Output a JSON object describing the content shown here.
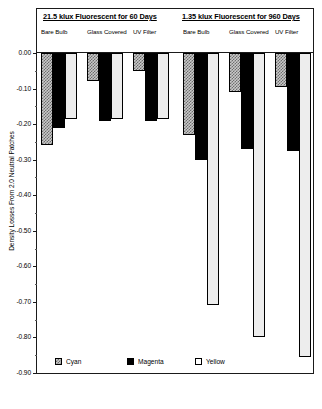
{
  "chart_data": {
    "type": "bar",
    "title": "",
    "xlabel": "",
    "ylabel": "Density Losses From 2.0 Neutral Patches",
    "ylim": [
      -0.9,
      0.0
    ],
    "ytick_step": 0.1,
    "grid": false,
    "legend_position": "bottom-left",
    "ytick_labels": [
      "0.00",
      "-0.10",
      "-0.20",
      "-0.30",
      "-0.40",
      "-0.50",
      "-0.60",
      "-0.70",
      "-0.80",
      "-0.90"
    ],
    "ytick_values": [
      0.0,
      -0.1,
      -0.2,
      -0.3,
      -0.4,
      -0.5,
      -0.6,
      -0.7,
      -0.8,
      -0.9
    ],
    "legend": [
      {
        "name": "Cyan",
        "swatch": "hatched"
      },
      {
        "name": "Magenta",
        "swatch": "solid-black"
      },
      {
        "name": "Yellow",
        "swatch": "white-outline"
      }
    ],
    "groups": [
      {
        "title": "21.5 klux Fluorescent for 60 Days",
        "categories": [
          "Bare Bulb",
          "Glass Covered",
          "UV Filter"
        ],
        "series": [
          {
            "name": "Cyan",
            "values": [
              -0.26,
              -0.08,
              -0.05
            ]
          },
          {
            "name": "Magenta",
            "values": [
              -0.21,
              -0.19,
              -0.19
            ]
          },
          {
            "name": "Yellow",
            "values": [
              -0.185,
              -0.185,
              -0.185
            ]
          }
        ]
      },
      {
        "title": "1.35 klux Fluorescent for 960 Days",
        "categories": [
          "Bare Bulb",
          "Glass Covered",
          "UV Filter"
        ],
        "series": [
          {
            "name": "Cyan",
            "values": [
              -0.23,
              -0.11,
              -0.095
            ]
          },
          {
            "name": "Magenta",
            "values": [
              -0.3,
              -0.27,
              -0.275
            ]
          },
          {
            "name": "Yellow",
            "values": [
              -0.71,
              -0.8,
              -0.855
            ]
          }
        ]
      }
    ]
  }
}
